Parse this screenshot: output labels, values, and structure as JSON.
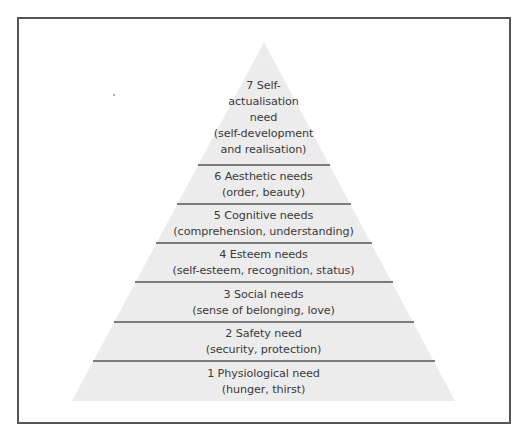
{
  "diagram": {
    "type": "pyramid",
    "title": "",
    "colors": {
      "fill": "#ececec",
      "divider": "#555555",
      "text": "#3a3a3a",
      "frame": "#555555"
    },
    "levels": [
      {
        "number": 7,
        "lines": [
          "7 Self-",
          "actualisation",
          "need",
          "(self-development",
          "and realisation)"
        ]
      },
      {
        "number": 6,
        "lines": [
          "6 Aesthetic needs",
          "(order, beauty)"
        ]
      },
      {
        "number": 5,
        "lines": [
          "5 Cognitive needs",
          "(comprehension, understanding)"
        ]
      },
      {
        "number": 4,
        "lines": [
          "4 Esteem needs",
          "(self-esteem, recognition, status)"
        ]
      },
      {
        "number": 3,
        "lines": [
          "3 Social needs",
          "(sense of belonging, love)"
        ]
      },
      {
        "number": 2,
        "lines": [
          "2 Safety need",
          "(security, protection)"
        ]
      },
      {
        "number": 1,
        "lines": [
          "1 Physiological need",
          "(hunger, thirst)"
        ]
      }
    ]
  }
}
